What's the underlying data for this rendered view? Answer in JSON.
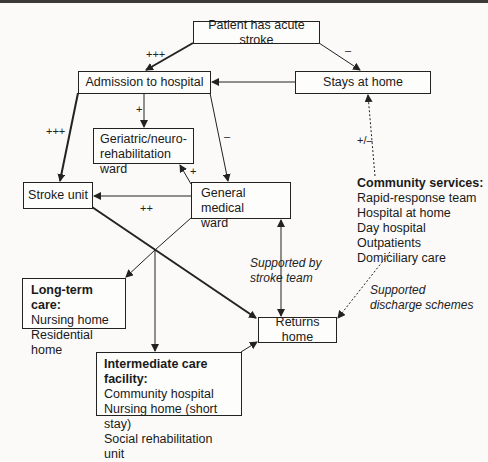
{
  "diagram": {
    "nodes": {
      "start": "Patient has acute stroke",
      "admission": "Admission to hospital",
      "stays_home": "Stays at home",
      "geriatric": [
        "Geriatric/neuro-",
        "rehabilitation ward"
      ],
      "stroke_unit": "Stroke unit",
      "general": [
        "General medical",
        "ward"
      ],
      "returns_home": "Returns home",
      "community": {
        "title": "Community services:",
        "items": [
          "Rapid-response team",
          "Hospital at home",
          "Day hospital",
          "Outpatients",
          "Domiciliary care"
        ]
      },
      "long_term": {
        "title": "Long-term care:",
        "items": [
          "Nursing home",
          "Residential home"
        ]
      },
      "intermediate": {
        "title": "Intermediate care facility:",
        "items": [
          "Community hospital",
          "Nursing home (short stay)",
          "Social rehabilitation unit"
        ]
      }
    },
    "edge_labels": {
      "start_admission": "+++",
      "start_home": "–",
      "admission_geriatric": "+",
      "admission_stroke": "+++",
      "admission_general": "–",
      "general_geriatric": "+",
      "general_stroke": "++",
      "home_community": "+/–",
      "stroke_team": [
        "Supported by",
        "stroke team"
      ],
      "discharge": [
        "Supported",
        "discharge schemes"
      ]
    },
    "colors": {
      "line": "#222222",
      "background": "#fbfaf8"
    }
  }
}
